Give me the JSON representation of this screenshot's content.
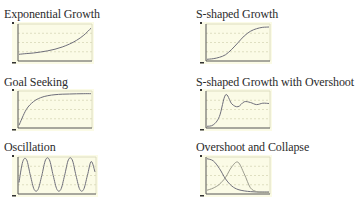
{
  "colors": {
    "panel_bg": "#fbfbe6",
    "axis": "#555555",
    "grid": "#d8d8b8",
    "curve": "#6e6e7a",
    "curve_secondary": "#9a9a8c"
  },
  "chart_data": [
    {
      "type": "line",
      "title": "Exponential Growth",
      "xlabel": "",
      "ylabel": "",
      "grid": true,
      "series": [
        {
          "name": "stock",
          "x": [
            0,
            1,
            2,
            3,
            4,
            5,
            6,
            7,
            8,
            9,
            10
          ],
          "values": [
            0.18,
            0.2,
            0.22,
            0.25,
            0.29,
            0.34,
            0.41,
            0.5,
            0.62,
            0.78,
            1.0
          ]
        }
      ],
      "ylim": [
        0,
        1.1
      ]
    },
    {
      "type": "line",
      "title": "S-shaped Growth",
      "xlabel": "",
      "ylabel": "",
      "grid": true,
      "series": [
        {
          "name": "stock",
          "x": [
            0,
            1,
            2,
            3,
            4,
            5,
            6,
            7,
            8,
            9,
            10
          ],
          "values": [
            0.02,
            0.04,
            0.08,
            0.16,
            0.32,
            0.52,
            0.72,
            0.86,
            0.94,
            0.98,
            0.99
          ]
        }
      ],
      "ylim": [
        0,
        1.05
      ]
    },
    {
      "type": "line",
      "title": "Goal Seeking",
      "xlabel": "",
      "ylabel": "",
      "grid": true,
      "series": [
        {
          "name": "stock",
          "x": [
            0,
            1,
            2,
            3,
            4,
            5,
            6,
            7,
            8,
            9,
            10
          ],
          "values": [
            0.05,
            0.52,
            0.76,
            0.88,
            0.94,
            0.97,
            0.985,
            0.99,
            0.995,
            1.0,
            1.0
          ]
        }
      ],
      "ylim": [
        0,
        1.05
      ]
    },
    {
      "type": "line",
      "title": "S-shaped Growth with Overshoot",
      "xlabel": "",
      "ylabel": "",
      "grid": true,
      "series": [
        {
          "name": "stock",
          "x": [
            0,
            1,
            2,
            3,
            4,
            5,
            6,
            7,
            8,
            9,
            10
          ],
          "values": [
            0.02,
            0.06,
            0.3,
            0.92,
            0.66,
            0.58,
            0.72,
            0.7,
            0.64,
            0.68,
            0.67
          ]
        }
      ],
      "ylim": [
        0,
        1.0
      ]
    },
    {
      "type": "line",
      "title": "Oscillation",
      "xlabel": "",
      "ylabel": "",
      "grid": true,
      "series": [
        {
          "name": "stock",
          "x": [
            0,
            0.5,
            1,
            1.5,
            2,
            2.5,
            3,
            3.5,
            4,
            4.5,
            5,
            5.5,
            6,
            6.5,
            7,
            7.5,
            8,
            8.5,
            9,
            9.5,
            10
          ],
          "values": [
            0.3,
            0.9,
            0.95,
            0.5,
            0.1,
            0.1,
            0.5,
            0.95,
            0.95,
            0.5,
            0.1,
            0.1,
            0.5,
            0.95,
            0.95,
            0.5,
            0.1,
            0.1,
            0.5,
            0.9,
            0.6
          ]
        }
      ],
      "ylim": [
        0,
        1.0
      ]
    },
    {
      "type": "line",
      "title": "Overshoot and Collapse",
      "xlabel": "",
      "ylabel": "",
      "grid": true,
      "series": [
        {
          "name": "resource",
          "x": [
            0,
            1,
            2,
            3,
            4,
            5,
            6,
            7,
            8,
            9,
            10
          ],
          "values": [
            0.98,
            0.92,
            0.7,
            0.4,
            0.2,
            0.1,
            0.06,
            0.04,
            0.03,
            0.03,
            0.03
          ]
        },
        {
          "name": "population",
          "x": [
            0,
            1,
            2,
            3,
            4,
            5,
            6,
            7,
            8,
            9,
            10
          ],
          "values": [
            0.08,
            0.14,
            0.25,
            0.45,
            0.75,
            0.88,
            0.55,
            0.15,
            0.04,
            0.02,
            0.02
          ]
        }
      ],
      "ylim": [
        0,
        1.0
      ]
    }
  ]
}
